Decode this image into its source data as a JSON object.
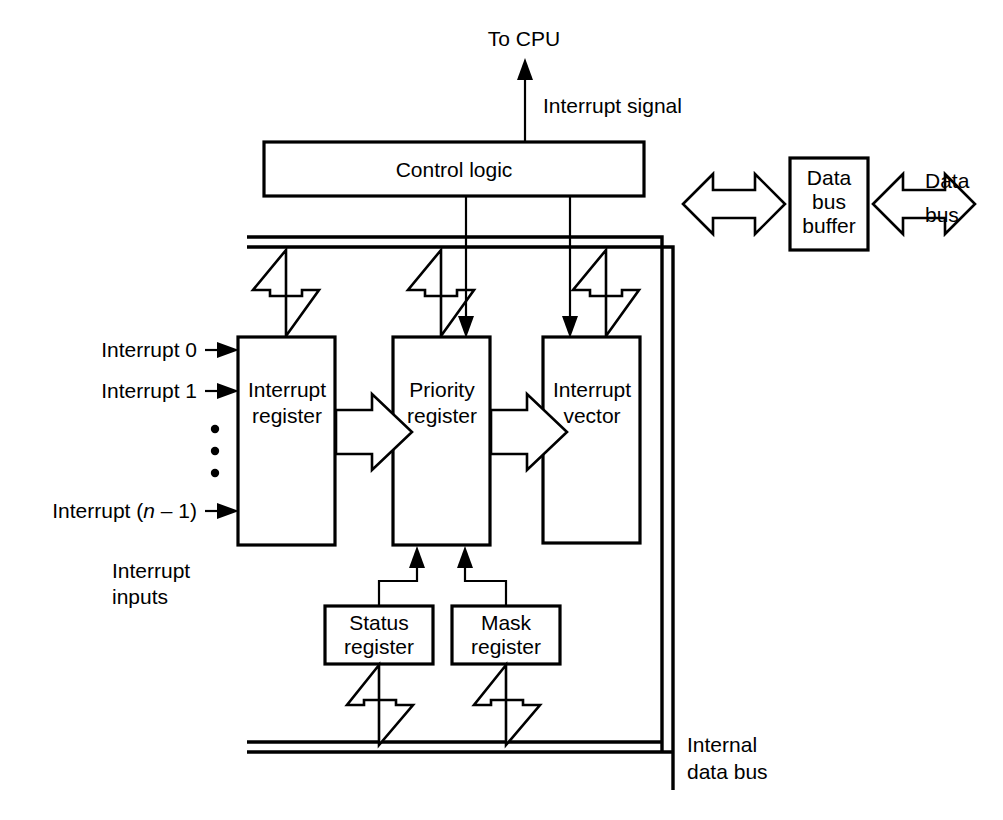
{
  "diagram": {
    "stroke_color": "#000000",
    "background_color": "#ffffff",
    "blocks": {
      "control_logic": {
        "label": "Control logic"
      },
      "data_bus_buffer": {
        "line1": "Data",
        "line2": "bus",
        "line3": "buffer"
      },
      "interrupt_register": {
        "line1": "Interrupt",
        "line2": "register"
      },
      "priority_register": {
        "line1": "Priority",
        "line2": "register"
      },
      "interrupt_vector": {
        "line1": "Interrupt",
        "line2": "vector"
      },
      "status_register": {
        "line1": "Status",
        "line2": "register"
      },
      "mask_register": {
        "line1": "Mask",
        "line2": "register"
      }
    },
    "labels": {
      "to_cpu": "To CPU",
      "interrupt_signal": "Interrupt signal",
      "data_bus": {
        "line1": "Data",
        "line2": "bus"
      },
      "internal_data_bus": {
        "line1": "Internal",
        "line2": "data bus"
      },
      "interrupt_inputs": {
        "line1": "Interrupt",
        "line2": "inputs"
      },
      "interrupt_0": "Interrupt 0",
      "interrupt_1": "Interrupt 1",
      "interrupt_n": {
        "prefix": "Interrupt (",
        "italic": "n",
        "suffix": " – 1)"
      }
    },
    "icons": {
      "bidirectional_arrow": "double-headed-block-arrow",
      "flow_arrow": "right-block-arrow",
      "signal_arrow": "thin-line-arrow",
      "ellipsis": "vertical-dots"
    }
  }
}
